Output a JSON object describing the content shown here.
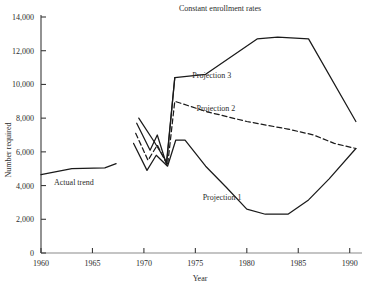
{
  "chart_data": {
    "type": "line",
    "title": "Constant enrollment rates",
    "xlabel": "Year",
    "ylabel": "Number required",
    "xlim": [
      1960,
      1991
    ],
    "ylim": [
      0,
      14000
    ],
    "grid": false,
    "legend_position": "inline-annotations",
    "xticks": [
      1960,
      1965,
      1970,
      1975,
      1980,
      1985,
      1990
    ],
    "xtick_labels": [
      "1960",
      "1965",
      "1970",
      "1975",
      "1980",
      "1985",
      "1990"
    ],
    "yticks": [
      0,
      2000,
      4000,
      6000,
      8000,
      10000,
      12000,
      14000
    ],
    "ytick_labels": [
      "0",
      "2,000",
      "4,000",
      "6,000",
      "8,000",
      "10,000",
      "12,000",
      "14,000"
    ],
    "annotations": [
      {
        "text": "Actual trend",
        "x": 1963.2,
        "y": 4050
      },
      {
        "text": "Projection 1",
        "x": 1977.6,
        "y": 3150
      },
      {
        "text": "Projection 2",
        "x": 1977.0,
        "y": 8450
      },
      {
        "text": "Projection 3",
        "x": 1976.6,
        "y": 10400
      }
    ],
    "series": [
      {
        "name": "Actual trend",
        "style": "solid",
        "color": "#1a1a1a",
        "x": [
          1960.0,
          1963.0,
          1966.2,
          1967.3
        ],
        "values": [
          4650,
          5000,
          5050,
          5300
        ]
      },
      {
        "name": "Transition fan",
        "style": "solid",
        "color": "#1a1a1a",
        "x": [
          1969.3,
          1970.6,
          1971.3,
          1972.2,
          1973.0
        ],
        "values": [
          7700,
          6100,
          7000,
          5250,
          10400
        ]
      },
      {
        "name": "Projection 1",
        "style": "solid",
        "color": "#1a1a1a",
        "x": [
          1969.0,
          1970.3,
          1971.2,
          1972.3,
          1973.1,
          1974.0,
          1976.0,
          1978.0,
          1980.0,
          1981.8,
          1984.0,
          1986.0,
          1988.0,
          1990.6
        ],
        "values": [
          6500,
          4900,
          5800,
          5150,
          6700,
          6700,
          5150,
          3900,
          2600,
          2300,
          2300,
          3150,
          4400,
          6200
        ]
      },
      {
        "name": "Projection 2",
        "style": "dashed",
        "color": "#1a1a1a",
        "x": [
          1969.2,
          1970.4,
          1971.3,
          1972.3,
          1973.0,
          1976.0,
          1980.0,
          1984.0,
          1986.5,
          1988.5,
          1990.6
        ],
        "values": [
          7100,
          5500,
          6400,
          5200,
          9000,
          8400,
          7800,
          7350,
          7000,
          6500,
          6200
        ]
      },
      {
        "name": "Projection 3",
        "style": "solid",
        "color": "#1a1a1a",
        "x": [
          1969.5,
          1971.0,
          1972.2,
          1973.0,
          1976.0,
          1981.0,
          1983.0,
          1986.0,
          1990.6
        ],
        "values": [
          8000,
          6600,
          5400,
          10400,
          10600,
          12700,
          12800,
          12700,
          7800
        ]
      }
    ]
  }
}
